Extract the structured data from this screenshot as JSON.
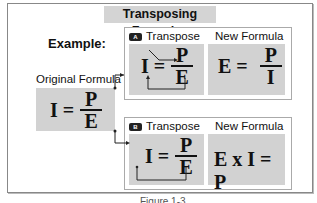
{
  "title": "Transposing Formulas",
  "example_label": "Example:",
  "original": {
    "label": "Original Formula",
    "lhs": "I =",
    "numerator": "P",
    "denominator": "E"
  },
  "panels": [
    {
      "badge": "A",
      "transpose_label": "Transpose",
      "new_label": "New Formula",
      "transpose": {
        "lhs": "I =",
        "numerator": "P",
        "denominator": "E"
      },
      "new_formula": {
        "lhs": "E =",
        "numerator": "P",
        "denominator": "I"
      }
    },
    {
      "badge": "B",
      "transpose_label": "Transpose",
      "new_label": "New Formula",
      "transpose": {
        "lhs": "I =",
        "numerator": "P",
        "denominator": "E"
      },
      "new_formula": {
        "text": "E x I = P"
      }
    }
  ],
  "caption": "Figure 1-3"
}
